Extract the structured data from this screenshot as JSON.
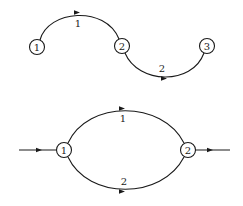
{
  "diagram_top": {
    "title": "series path",
    "nodes": [
      {
        "id": "1",
        "label": "1"
      },
      {
        "id": "2",
        "label": "2"
      },
      {
        "id": "3",
        "label": "3"
      }
    ],
    "edges": [
      {
        "from": "1",
        "to": "2",
        "label": "1"
      },
      {
        "from": "2",
        "to": "3",
        "label": "2"
      }
    ]
  },
  "diagram_bottom": {
    "title": "parallel paths",
    "nodes": [
      {
        "id": "1",
        "label": "1"
      },
      {
        "id": "2",
        "label": "2"
      }
    ],
    "edges": [
      {
        "from": "1",
        "to": "2",
        "label": "1"
      },
      {
        "from": "1",
        "to": "2",
        "label": "2"
      }
    ],
    "input_arrow": true,
    "output_arrow": true
  },
  "colors": {
    "stroke": "#1a1a1a",
    "background": "#ffffff"
  }
}
